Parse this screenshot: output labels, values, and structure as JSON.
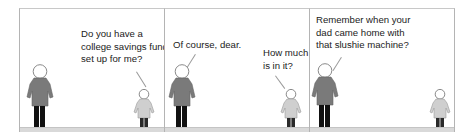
{
  "comic": {
    "panels": [
      {
        "speaker": "child",
        "dialogue": "Do you have a\ncollege savings fund\nset up for me?"
      },
      {
        "speaker_adult": "adult",
        "adult_dialogue": "Of course, dear.",
        "speaker_child": "child",
        "child_dialogue": "How much\nis in it?"
      },
      {
        "speaker": "adult",
        "dialogue": "Remember when your\ndad came home with\nthat slushie machine?"
      }
    ],
    "colors": {
      "adult_body": "#7a7a7a",
      "child_body": "#cfcfcf",
      "adult_legs": "#111111",
      "child_legs": "#2a2a2a",
      "ground": "#d9d9d9",
      "border": "#b4b4b4"
    }
  }
}
